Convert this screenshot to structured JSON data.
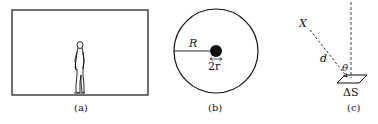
{
  "panels": {
    "a": {
      "caption": "(a)",
      "content": "standing-person-in-room"
    },
    "b": {
      "caption": "(b)",
      "radius_label": "R",
      "diameter_label": "2r"
    },
    "c": {
      "caption": "(c)",
      "point_label": "X",
      "distance_label": "d",
      "angle_label": "θ",
      "area_label": "ΔS"
    }
  },
  "colors": {
    "stroke": "#111111",
    "background": "#ffffff"
  }
}
